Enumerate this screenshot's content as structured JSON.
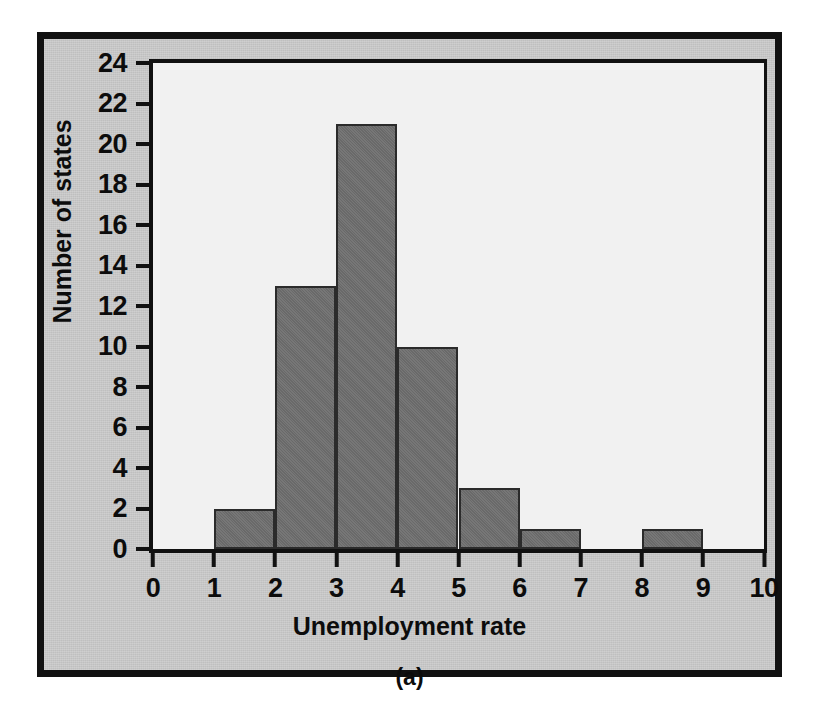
{
  "figure": {
    "caption": "(a)",
    "background_color": "#c9c9c9",
    "border_color": "#111111",
    "plot_background_color": "#f1f1f1",
    "bar_color": "#6f6f6f",
    "bar_edge_color": "#2b2b2b"
  },
  "chart_data": {
    "type": "bar",
    "title": "",
    "subtitle": "",
    "xlabel": "Unemployment rate",
    "ylabel": "Number of states",
    "caption": "(a)",
    "histogram": true,
    "bin_width": 1,
    "bin_edges": [
      0,
      1,
      2,
      3,
      4,
      5,
      6,
      7,
      8,
      9,
      10
    ],
    "categories": [
      "0-1",
      "1-2",
      "2-3",
      "3-4",
      "4-5",
      "5-6",
      "6-7",
      "7-8",
      "8-9",
      "9-10"
    ],
    "values": [
      0,
      2,
      13,
      21,
      10,
      3,
      1,
      0,
      1,
      0
    ],
    "bars": [
      {
        "x0": 0,
        "x1": 1,
        "value": 0
      },
      {
        "x0": 1,
        "x1": 2,
        "value": 2
      },
      {
        "x0": 2,
        "x1": 3,
        "value": 13
      },
      {
        "x0": 3,
        "x1": 4,
        "value": 21
      },
      {
        "x0": 4,
        "x1": 5,
        "value": 10
      },
      {
        "x0": 5,
        "x1": 6,
        "value": 3
      },
      {
        "x0": 6,
        "x1": 7,
        "value": 1
      },
      {
        "x0": 7,
        "x1": 8,
        "value": 0
      },
      {
        "x0": 8,
        "x1": 9,
        "value": 1
      },
      {
        "x0": 9,
        "x1": 10,
        "value": 0
      }
    ],
    "xlim": [
      0,
      10
    ],
    "ylim": [
      0,
      24
    ],
    "xticks": [
      0,
      1,
      2,
      3,
      4,
      5,
      6,
      7,
      8,
      9,
      10
    ],
    "xtick_labels": [
      "0",
      "1",
      "2",
      "3",
      "4",
      "5",
      "6",
      "7",
      "8",
      "9",
      "10"
    ],
    "yticks": [
      0,
      2,
      4,
      6,
      8,
      10,
      12,
      14,
      16,
      18,
      20,
      22,
      24
    ],
    "ytick_labels": [
      "0",
      "2",
      "4",
      "6",
      "8",
      "10",
      "12",
      "14",
      "16",
      "18",
      "20",
      "22",
      "24"
    ],
    "grid": false,
    "legend": null,
    "total_count": 51
  }
}
